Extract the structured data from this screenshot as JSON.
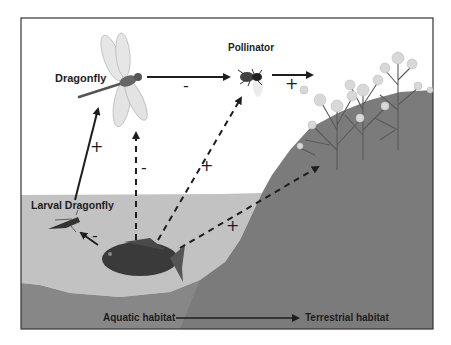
{
  "diagram": {
    "nodes": [
      {
        "id": "dragonfly",
        "label": "Dragonfly",
        "icon": "dragonfly-icon"
      },
      {
        "id": "pollinator",
        "label": "Pollinator",
        "icon": "bee-icon"
      },
      {
        "id": "plants",
        "label": "",
        "icon": "flowering-plant-icon"
      },
      {
        "id": "larval_dragonfly",
        "label": "Larval Dragonfly",
        "icon": "larva-icon"
      },
      {
        "id": "fish",
        "label": "",
        "icon": "fish-icon"
      }
    ],
    "edges": [
      {
        "from": "larval_dragonfly",
        "to": "dragonfly",
        "style": "solid",
        "sign": "+"
      },
      {
        "from": "dragonfly",
        "to": "pollinator",
        "style": "solid",
        "sign": "-"
      },
      {
        "from": "pollinator",
        "to": "plants",
        "style": "solid",
        "sign": "+"
      },
      {
        "from": "fish",
        "to": "larval_dragonfly",
        "style": "solid",
        "sign": "-"
      },
      {
        "from": "fish",
        "to": "dragonfly",
        "style": "dashed",
        "sign": "-"
      },
      {
        "from": "fish",
        "to": "pollinator",
        "style": "dashed",
        "sign": "+"
      },
      {
        "from": "fish",
        "to": "plants",
        "style": "dashed",
        "sign": "+"
      }
    ],
    "axis": {
      "start_label": "Aquatic habitat",
      "end_label": "Terrestrial habitat"
    },
    "colors": {
      "sky": "#ffffff",
      "water": "#c2c2c2",
      "land": "#7d7d7d",
      "lake_bed": "#8a8a8a",
      "ink": "#1e1e1e"
    }
  }
}
